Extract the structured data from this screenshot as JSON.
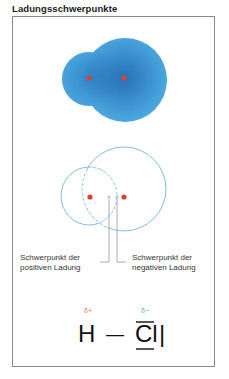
{
  "title": "Ladungsschwerpunkte",
  "diagram": {
    "colors": {
      "cloud": "#4aa6de",
      "cloud_dark": "#1f6fb8",
      "nucleus": "#e0412a",
      "circle": "#6fb8dc",
      "frame": "#8a8a8a",
      "delta_plus": "#e8773d",
      "delta_minus": "#5aa8d8"
    },
    "labels": {
      "positive_line1": "Schwerpunkt der",
      "positive_line2": "positiven Ladung",
      "negative_line1": "Schwerpunkt der",
      "negative_line2": "negativen Ladung"
    },
    "formula": {
      "delta_plus": "δ+",
      "delta_minus": "δ−",
      "atom_h": "H",
      "bond": "—",
      "atom_cl": "Cl",
      "lone_pair": "|"
    }
  }
}
